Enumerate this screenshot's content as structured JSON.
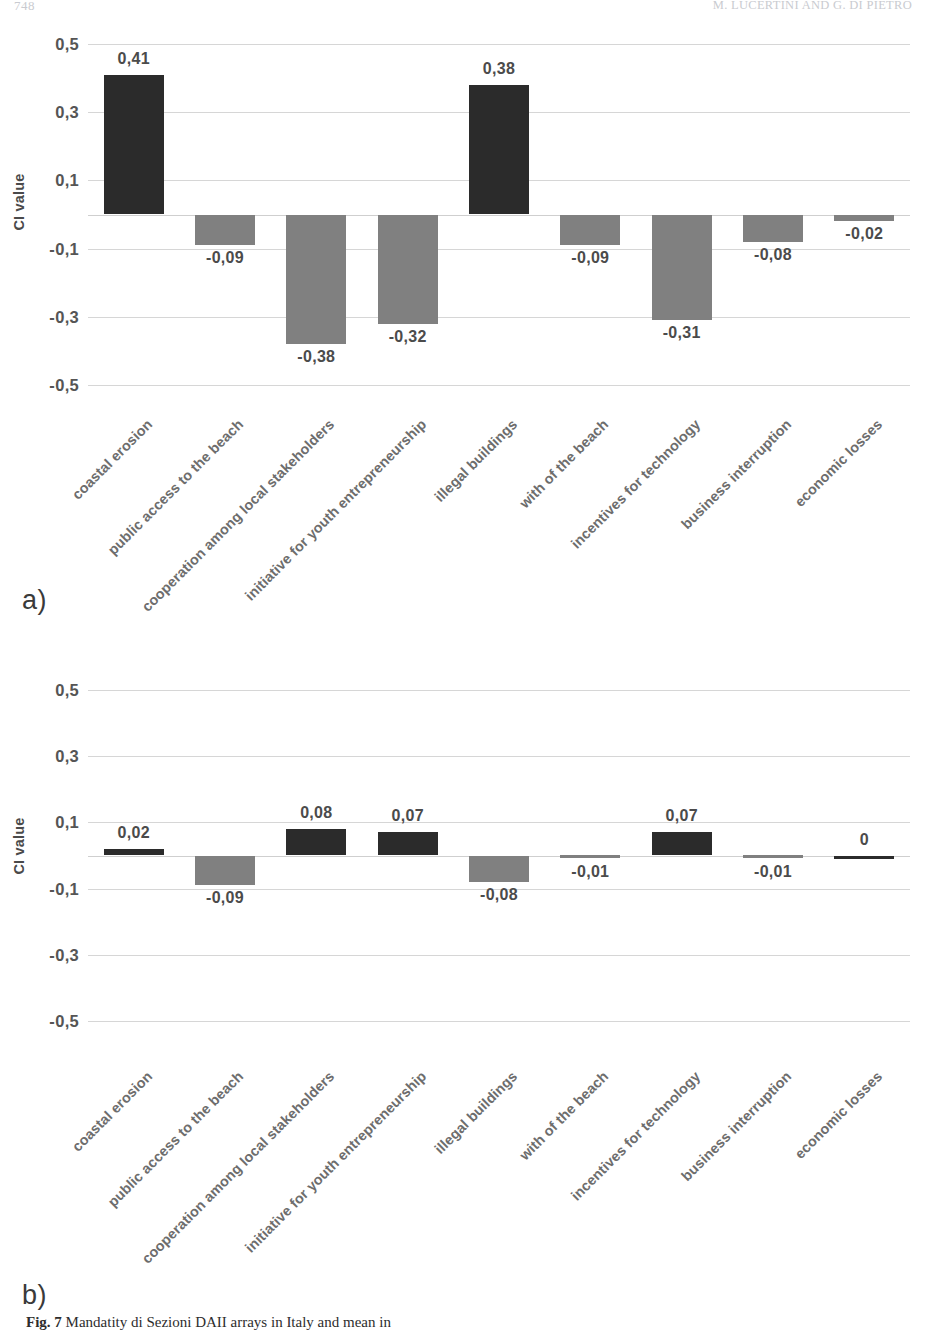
{
  "page": {
    "folio": "748",
    "running_head": "M. LUCERTINI AND G. DI PIETRO"
  },
  "figure": {
    "caption_label": "Fig. 7",
    "caption_text": "Mandatity di Sezioni DAII arrays in Italy and mean in"
  },
  "panels": [
    {
      "id": "a",
      "letter": "a)",
      "axis_title": "CI value",
      "chart_data": {
        "type": "bar",
        "title": "",
        "xlabel": "",
        "ylabel": "CI value",
        "ylim": [
          -0.5,
          0.5
        ],
        "yticks": [
          0.5,
          0.3,
          0.1,
          -0.1,
          -0.3,
          -0.5
        ],
        "ytick_labels": [
          "0,5",
          "0,3",
          "0,1",
          "-0,1",
          "-0,3",
          "-0,5"
        ],
        "grid": true,
        "legend": "none",
        "categories": [
          "coastal erosion",
          "public access to the beach",
          "cooperation among local stakeholders",
          "initiative for youth entrepreneurship",
          "illegal buildings",
          "with of the beach",
          "incentives for technology",
          "business interruption",
          "economic losses"
        ],
        "values": [
          0.41,
          -0.09,
          -0.38,
          -0.32,
          0.38,
          -0.09,
          -0.31,
          -0.08,
          -0.02
        ],
        "value_labels": [
          "0,41",
          "-0,09",
          "-0,38",
          "-0,32",
          "0,38",
          "-0,09",
          "-0,31",
          "-0,08",
          "-0,02"
        ]
      }
    },
    {
      "id": "b",
      "letter": "b)",
      "axis_title": "CI value",
      "chart_data": {
        "type": "bar",
        "title": "",
        "xlabel": "",
        "ylabel": "CI value",
        "ylim": [
          -0.5,
          0.5
        ],
        "yticks": [
          0.5,
          0.3,
          0.1,
          -0.1,
          -0.3,
          -0.5
        ],
        "ytick_labels": [
          "0,5",
          "0,3",
          "0,1",
          "-0,1",
          "-0,3",
          "-0,5"
        ],
        "grid": true,
        "legend": "none",
        "categories": [
          "coastal erosion",
          "public access to the beach",
          "cooperation among local stakeholders",
          "initiative for youth entrepreneurship",
          "illegal buildings",
          "with of the beach",
          "incentives for technology",
          "business interruption",
          "economic losses"
        ],
        "values": [
          0.02,
          -0.09,
          0.08,
          0.07,
          -0.08,
          -0.01,
          0.07,
          -0.01,
          0
        ],
        "value_labels": [
          "0,02",
          "-0,09",
          "0,08",
          "0,07",
          "-0,08",
          "-0,01",
          "0,07",
          "-0,01",
          "0"
        ]
      }
    }
  ],
  "colors": {
    "positive_bar": "#2b2b2b",
    "negative_bar": "#808080",
    "gridline": "#d6d6d6",
    "tick_text": "#555555",
    "category_text": "#6d6d6d"
  }
}
